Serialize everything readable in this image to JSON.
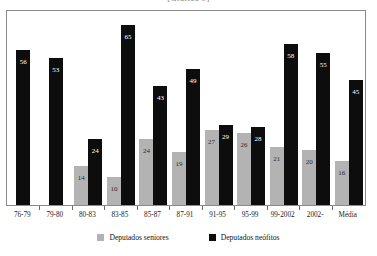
{
  "chart_data": {
    "type": "bar",
    "title": "[Gráfico 5]",
    "xlabel": "",
    "ylabel": "",
    "ylim": [
      0,
      70
    ],
    "grid": false,
    "legend_position": "bottom-center",
    "categories": [
      "76-79",
      "79-80",
      "80-83",
      "83-85",
      "85-87",
      "87-91",
      "91-95",
      "95-99",
      "99-2002",
      "2002-",
      "Média"
    ],
    "series": [
      {
        "name": "Deputados seniores",
        "color": "#b3b3b3",
        "values": [
          null,
          null,
          14,
          10,
          24,
          19,
          27,
          26,
          21,
          20,
          16
        ]
      },
      {
        "name": "Deputados neófitos",
        "color": "#0d0d0d",
        "values": [
          56,
          53,
          24,
          65,
          43,
          49,
          29,
          28,
          58,
          55,
          45
        ]
      }
    ]
  },
  "legend": {
    "items": [
      {
        "label": "Deputados seniores",
        "swatch": "senior"
      },
      {
        "label": "Deputados neófitos",
        "swatch": "neofito"
      }
    ]
  }
}
